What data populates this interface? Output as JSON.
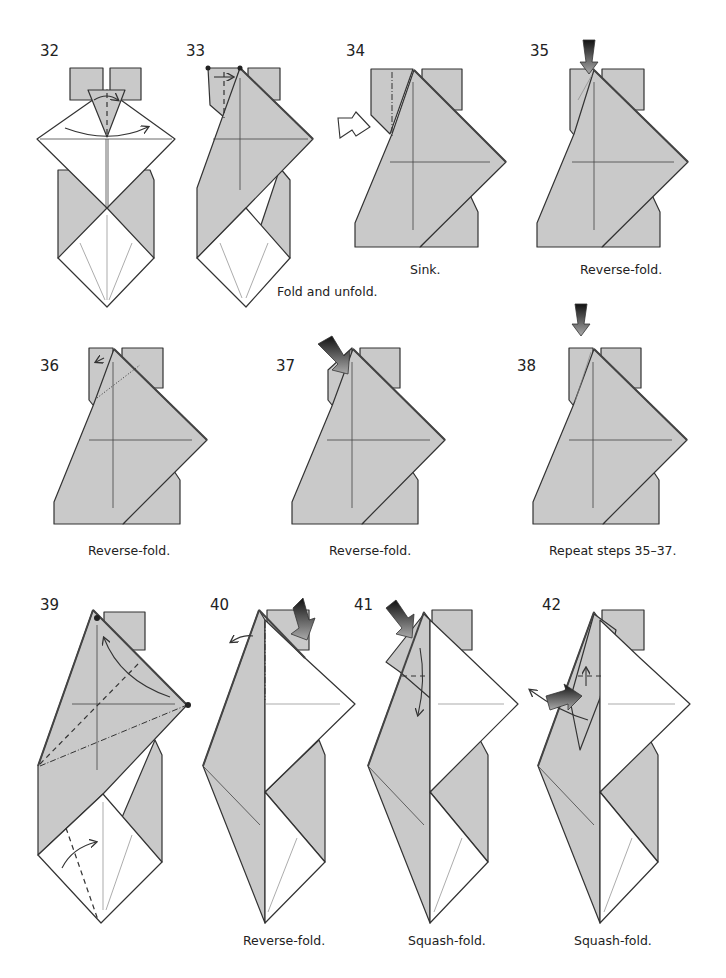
{
  "steps": [
    {
      "number": "32",
      "caption": ""
    },
    {
      "number": "33",
      "caption": "Fold and unfold."
    },
    {
      "number": "34",
      "caption": "Sink."
    },
    {
      "number": "35",
      "caption": "Reverse-fold."
    },
    {
      "number": "36",
      "caption": "Reverse-fold."
    },
    {
      "number": "37",
      "caption": "Reverse-fold."
    },
    {
      "number": "38",
      "caption": "Repeat steps 35–37."
    },
    {
      "number": "39",
      "caption": ""
    },
    {
      "number": "40",
      "caption": "Reverse-fold."
    },
    {
      "number": "41",
      "caption": "Squash-fold."
    },
    {
      "number": "42",
      "caption": "Squash-fold."
    }
  ],
  "colors": {
    "paper_colored": "#c9c9c9",
    "paper_white": "#ffffff",
    "line": "#333333"
  }
}
